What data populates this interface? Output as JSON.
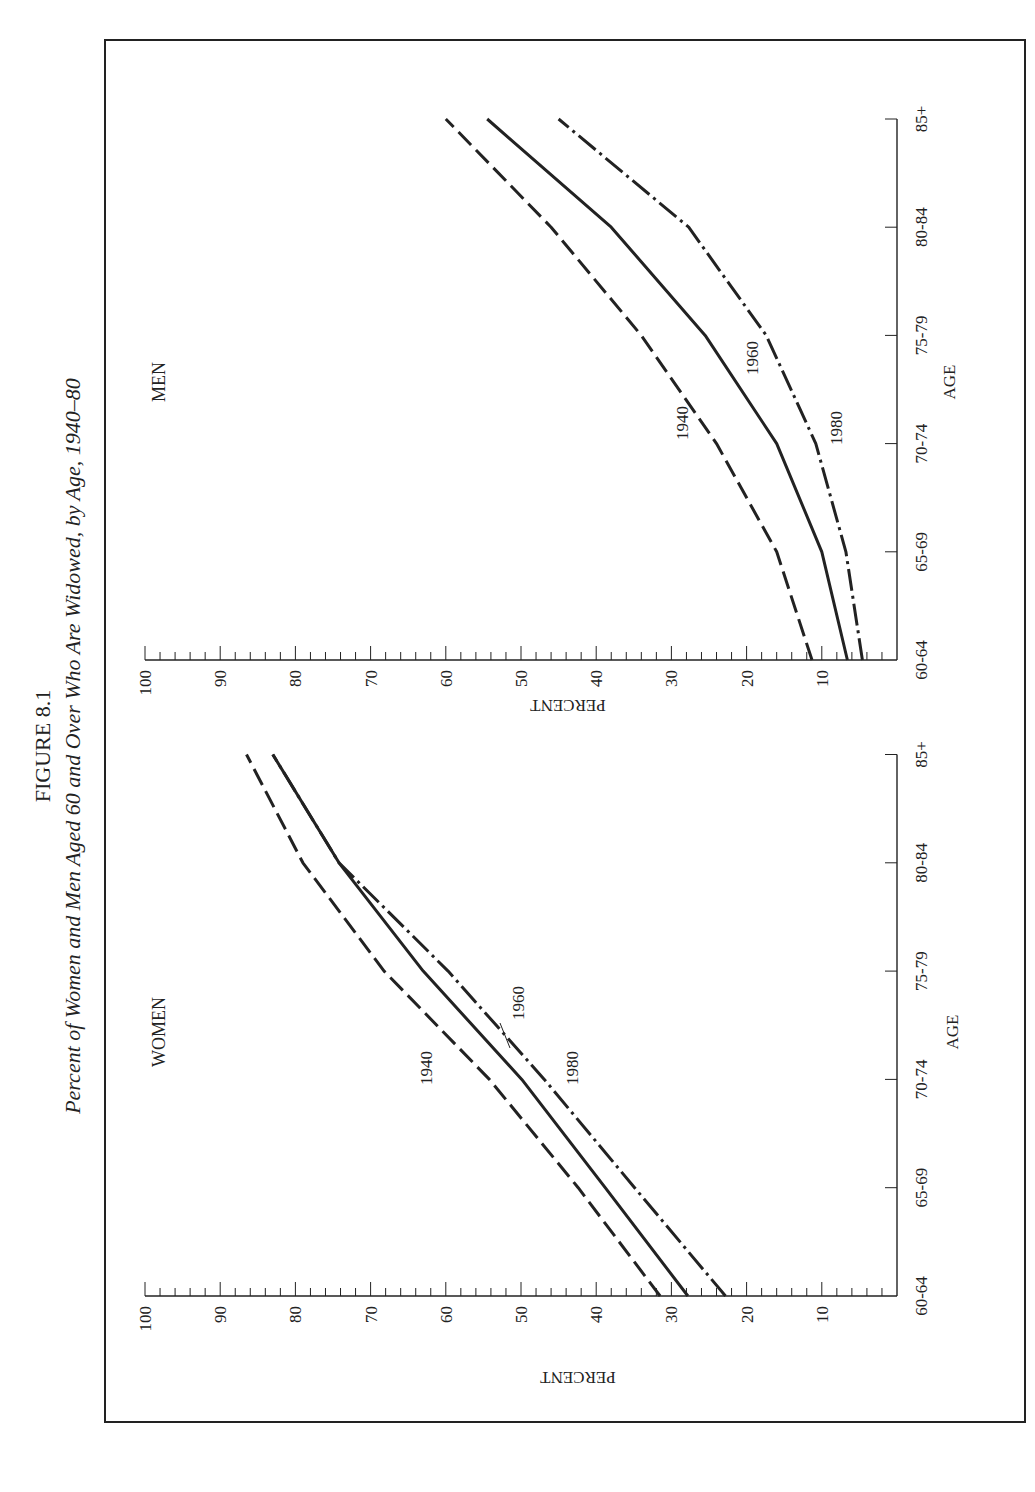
{
  "figure": {
    "label": "FIGURE 8.1",
    "title": "Percent of Women and Men Aged 60 and Over Who Are Widowed, by Age, 1940–80",
    "ink_color": "#222222",
    "background": "#ffffff"
  },
  "chart_data": [
    {
      "type": "line",
      "panel": "WOMEN",
      "title": "WOMEN",
      "xlabel": "AGE",
      "ylabel": "PERCENT",
      "categories": [
        "60-64",
        "65-69",
        "70-74",
        "75-79",
        "80-84",
        "85+"
      ],
      "ylim": [
        0,
        100
      ],
      "yticks": [
        10,
        20,
        30,
        40,
        50,
        60,
        70,
        80,
        90,
        100
      ],
      "grid": false,
      "orientation": "rotated 90° counter-clockwise",
      "series": [
        {
          "name": "1940",
          "style": "dashed",
          "values": [
            31.5,
            42.4,
            54.2,
            68.2,
            79.0,
            86.5
          ]
        },
        {
          "name": "1960",
          "style": "solid",
          "values": [
            27.8,
            38.8,
            49.9,
            63.0,
            74.2,
            83.0
          ]
        },
        {
          "name": "1980",
          "style": "dash-dot",
          "values": [
            22.8,
            34.9,
            46.9,
            59.7,
            74.2,
            83.0
          ]
        }
      ]
    },
    {
      "type": "line",
      "panel": "MEN",
      "title": "MEN",
      "xlabel": "AGE",
      "ylabel": "PERCENT",
      "categories": [
        "60-64",
        "65-69",
        "70-74",
        "75-79",
        "80-84",
        "85+"
      ],
      "ylim": [
        0,
        100
      ],
      "yticks": [
        10,
        20,
        30,
        40,
        50,
        60,
        70,
        80,
        90,
        100
      ],
      "grid": false,
      "orientation": "rotated 90° counter-clockwise",
      "series": [
        {
          "name": "1940",
          "style": "dashed",
          "values": [
            11.3,
            16.0,
            24.0,
            34.0,
            46.0,
            60.0
          ]
        },
        {
          "name": "1960",
          "style": "solid",
          "values": [
            6.6,
            10.0,
            16.0,
            25.5,
            38.0,
            54.5
          ]
        },
        {
          "name": "1980",
          "style": "dash-dot",
          "values": [
            4.6,
            6.8,
            10.8,
            17.4,
            27.7,
            45.0
          ]
        }
      ]
    }
  ]
}
